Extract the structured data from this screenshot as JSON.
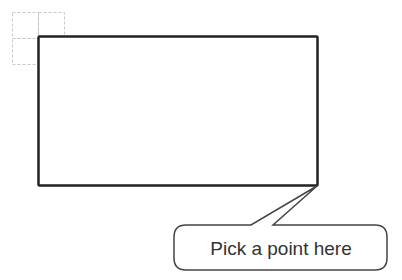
{
  "callout": {
    "text": "Pick a point here"
  },
  "colors": {
    "stroke": "#222222",
    "grid": "#c8c8c8",
    "callout_stroke": "#444444",
    "text": "#333333"
  }
}
